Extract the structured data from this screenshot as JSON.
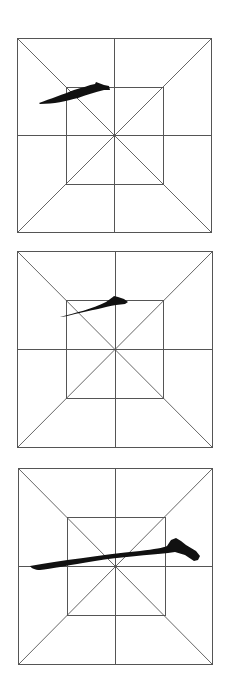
{
  "page": {
    "background": "#ffffff",
    "grid_line_color": "#555555",
    "ink_color": "#111111"
  },
  "grids": [
    {
      "name": "practice-grid-1",
      "box": {
        "x": 17,
        "y": 38,
        "size": 194
      },
      "stroke_path": "M39,103 C50,99 64,94 74,90 C82,88 89,85 95,84 L96,82 L104,85 L109,86 L110,90 L104,90 C95,92 86,95 78,98 C66,101 54,104 40,104 Z",
      "stroke_kind": "short rising horizontal (heng), faint"
    },
    {
      "name": "practice-grid-2",
      "box": {
        "x": 17,
        "y": 251,
        "size": 196
      },
      "stroke_path": "M60,317 C75,313 92,309 106,302 C110,299 113,297 114,296 L118,297 L124,299 L128,302 L125,304 L116,305 C105,307 90,311 75,314 C68,316 63,317 60,317 Z",
      "stroke_kind": "medium rising horizontal (heng) with heavy end"
    },
    {
      "name": "practice-grid-3",
      "box": {
        "x": 18,
        "y": 468,
        "size": 194
      },
      "stroke_path": "M30,566 C60,561 100,555 140,551 C155,549 163,548 167,546 L171,540 L176,538 L181,541 L186,545 L196,551 L200,556 L198,560 L194,561 L185,555 L175,552 L168,553 C150,555 120,557 95,561 C70,565 50,569 40,570 C35,570 31,568 30,566 Z",
      "stroke_kind": "long rising horizontal (heng) with hooked end"
    }
  ]
}
